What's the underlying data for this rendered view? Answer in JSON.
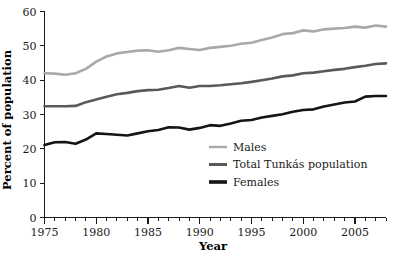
{
  "chart_data": {
    "type": "line",
    "title": "",
    "xlabel": "Year",
    "ylabel": "Percent of population",
    "xlim": [
      1975,
      2008
    ],
    "ylim": [
      0,
      60
    ],
    "grid": false,
    "legend_position": "inside-right-lower",
    "y_ticks": [
      0,
      10,
      20,
      30,
      40,
      50,
      60
    ],
    "y_tick_labels": [
      "0",
      "10",
      "20",
      "30",
      "40",
      "50",
      "60"
    ],
    "x_ticks": [
      1975,
      1980,
      1985,
      1990,
      1995,
      2000,
      2005
    ],
    "x_tick_labels": [
      "1975",
      "1980",
      "1985",
      "1990",
      "1995",
      "2000",
      "2005"
    ],
    "x_minor_tick_interval": 1,
    "x": [
      1975,
      1976,
      1977,
      1978,
      1979,
      1980,
      1981,
      1982,
      1983,
      1984,
      1985,
      1986,
      1987,
      1988,
      1989,
      1990,
      1991,
      1992,
      1993,
      1994,
      1995,
      1996,
      1997,
      1998,
      1999,
      2000,
      2001,
      2002,
      2003,
      2004,
      2005,
      2006,
      2007,
      2008
    ],
    "series": [
      {
        "name": "Males",
        "color": "#a9a9a9",
        "width": 2.6,
        "values": [
          42.0,
          41.9,
          41.6,
          42.0,
          43.3,
          45.4,
          46.9,
          47.8,
          48.2,
          48.6,
          48.7,
          48.3,
          48.7,
          49.4,
          49.1,
          48.8,
          49.4,
          49.7,
          50.0,
          50.6,
          50.9,
          51.7,
          52.4,
          53.4,
          53.7,
          54.5,
          54.2,
          54.8,
          55.0,
          55.2,
          55.6,
          55.3,
          55.9,
          55.6
        ]
      },
      {
        "name": "Total Tunkás population",
        "color": "#595959",
        "width": 2.6,
        "values": [
          32.4,
          32.4,
          32.4,
          32.5,
          33.6,
          34.4,
          35.2,
          35.9,
          36.3,
          36.8,
          37.1,
          37.2,
          37.7,
          38.3,
          37.8,
          38.3,
          38.3,
          38.5,
          38.8,
          39.1,
          39.5,
          40.0,
          40.5,
          41.1,
          41.4,
          42.0,
          42.2,
          42.6,
          43.0,
          43.3,
          43.8,
          44.2,
          44.7,
          44.9
        ]
      },
      {
        "name": "Females",
        "color": "#151515",
        "width": 2.6,
        "values": [
          21.1,
          21.9,
          22.0,
          21.5,
          22.7,
          24.5,
          24.3,
          24.1,
          23.9,
          24.5,
          25.1,
          25.5,
          26.3,
          26.2,
          25.6,
          26.1,
          26.9,
          26.7,
          27.4,
          28.2,
          28.4,
          29.1,
          29.6,
          30.1,
          30.8,
          31.3,
          31.5,
          32.3,
          32.9,
          33.5,
          33.8,
          35.2,
          35.4,
          35.4
        ]
      }
    ],
    "legend_entries": [
      {
        "label": "Males",
        "color": "#a9a9a9",
        "width": 2.4
      },
      {
        "label": "Total Tunkás population",
        "color": "#595959",
        "width": 3.0
      },
      {
        "label": "Females",
        "color": "#151515",
        "width": 3.6
      }
    ]
  }
}
